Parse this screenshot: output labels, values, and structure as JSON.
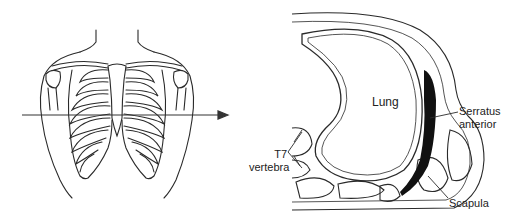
{
  "figure": {
    "left_panel": {
      "description": "Anterior view of thorax showing rib cage with horizontal section line at T7 level",
      "arrow": "section-plane-arrow"
    },
    "right_panel": {
      "description": "Transverse section of right hemithorax at T7 level",
      "labels": {
        "lung": "Lung",
        "serratus_line1": "Serratus",
        "serratus_line2": "anterior",
        "t7_line1": "T7",
        "t7_line2": "vertebra",
        "scapula": "Scapula"
      }
    },
    "colors": {
      "line": "#2a2a2a",
      "muscle_dark": "#111111",
      "background": "#ffffff"
    }
  }
}
